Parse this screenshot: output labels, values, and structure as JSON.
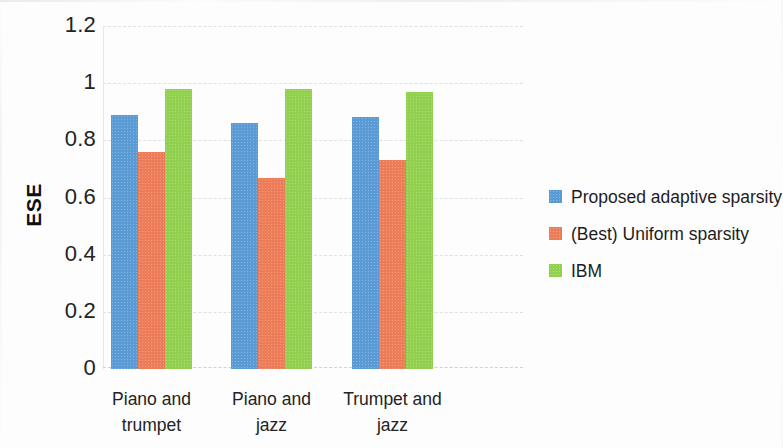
{
  "chart_data": {
    "type": "bar",
    "title": "",
    "xlabel": "",
    "ylabel": "ESE",
    "categories": [
      "Piano and trumpet",
      "Piano and jazz",
      "Trumpet and jazz"
    ],
    "category_lines": [
      [
        "Piano and",
        "trumpet"
      ],
      [
        "Piano and",
        "jazz"
      ],
      [
        "Trumpet and",
        "jazz"
      ]
    ],
    "series": [
      {
        "name": "Proposed adaptive sparsity",
        "color": "#5b9bd5",
        "values": [
          0.89,
          0.86,
          0.88
        ]
      },
      {
        "name": "(Best) Uniform sparsity",
        "color": "#ed7d59",
        "values": [
          0.76,
          0.67,
          0.73
        ]
      },
      {
        "name": "IBM",
        "color": "#92d050",
        "values": [
          0.98,
          0.98,
          0.97
        ]
      }
    ],
    "ylim": [
      0,
      1.2
    ],
    "ytick_values": [
      0,
      0.2,
      0.4,
      0.6,
      0.8,
      1,
      1.2
    ],
    "ytick_labels": [
      "0",
      "0.2",
      "0.4",
      "0.6",
      "0.8",
      "1",
      "1.2"
    ],
    "grid": true,
    "grid_axis": "y",
    "legend_position": "right"
  },
  "legend": {
    "entries": [
      {
        "label": "Proposed adaptive sparsity",
        "color": "#5b9bd5"
      },
      {
        "label": "(Best) Uniform sparsity",
        "color": "#ed7d59"
      },
      {
        "label": "IBM",
        "color": "#92d050"
      }
    ]
  }
}
